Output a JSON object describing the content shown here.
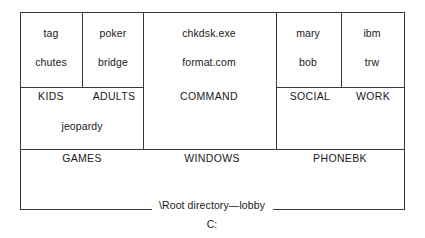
{
  "diagram": {
    "kind": "nested-box-directory-tree",
    "drive": "C:",
    "root": {
      "label": "\\Root directory—lobby",
      "children": [
        {
          "label": "GAMES",
          "files": [
            "jeopardy"
          ],
          "children": [
            {
              "label": "KIDS",
              "files": [
                "tag",
                "chutes"
              ]
            },
            {
              "label": "ADULTS",
              "files": [
                "poker",
                "bridge"
              ]
            }
          ]
        },
        {
          "label": "WINDOWS",
          "files": [],
          "children": [
            {
              "label": "COMMAND",
              "files": [
                "chkdsk.exe",
                "format.com"
              ]
            }
          ]
        },
        {
          "label": "PHONEBK",
          "files": [],
          "children": [
            {
              "label": "SOCIAL",
              "files": [
                "mary",
                "bob"
              ]
            },
            {
              "label": "WORK",
              "files": [
                "ibm",
                "trw"
              ]
            }
          ]
        }
      ]
    },
    "cells": {
      "kids": {
        "file1": "tag",
        "file2": "chutes",
        "dir": "KIDS"
      },
      "adults": {
        "file1": "poker",
        "file2": "bridge",
        "dir": "ADULTS"
      },
      "command": {
        "file1": "chkdsk.exe",
        "file2": "format.com",
        "dir": "COMMAND"
      },
      "social": {
        "file1": "mary",
        "file2": "bob",
        "dir": "SOCIAL"
      },
      "work": {
        "file1": "ibm",
        "file2": "trw",
        "dir": "WORK"
      },
      "games": {
        "file1": "jeopardy",
        "dir": "GAMES"
      },
      "windows": {
        "dir": "WINDOWS"
      },
      "phonebk": {
        "dir": "PHONEBK"
      }
    },
    "colors": {
      "line": "#3a3a3a",
      "text": "#1a1a1a",
      "background": "#ffffff"
    }
  }
}
